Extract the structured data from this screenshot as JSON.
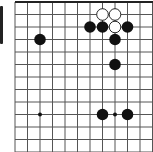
{
  "board": {
    "type": "go-board-fragment",
    "grid_x": [
      15,
      27.5,
      40,
      52.5,
      65,
      77.5,
      90,
      102.5,
      115,
      127.5,
      140,
      152.5
    ],
    "grid_y": [
      2,
      14.5,
      27,
      39.5,
      52,
      64.5,
      77,
      89.5,
      102,
      114.5,
      127,
      139.5,
      152
    ],
    "top_edge": true,
    "colors": {
      "line": "#555555",
      "edge": "#222222",
      "black": "#111111",
      "white": "#ffffff",
      "background": "#ffffff"
    },
    "star_points": [
      [
        2,
        9
      ],
      [
        8,
        9
      ]
    ],
    "stones": [
      {
        "color": "white",
        "col": 7,
        "row": 1
      },
      {
        "color": "white",
        "col": 8,
        "row": 1
      },
      {
        "color": "white",
        "col": 8,
        "row": 2
      },
      {
        "color": "black",
        "col": 6,
        "row": 2
      },
      {
        "color": "black",
        "col": 7,
        "row": 2
      },
      {
        "color": "black",
        "col": 9,
        "row": 2
      },
      {
        "color": "black",
        "col": 2,
        "row": 3
      },
      {
        "color": "black",
        "col": 8,
        "row": 3
      },
      {
        "color": "black",
        "col": 8,
        "row": 5
      },
      {
        "color": "black",
        "col": 7,
        "row": 9
      },
      {
        "color": "black",
        "col": 9,
        "row": 9
      }
    ]
  }
}
